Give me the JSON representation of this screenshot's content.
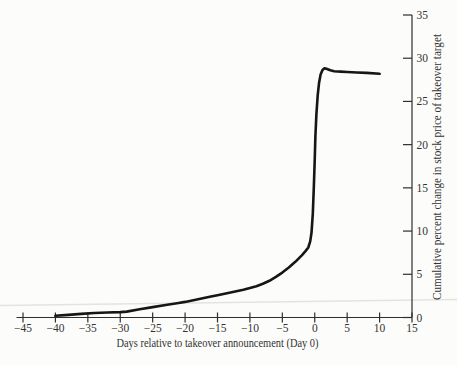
{
  "figure": {
    "background": "#fcfcfa",
    "curve_color": "#161616",
    "axis_color": "#2e2e2e",
    "label_color": "#333333",
    "artifact_line_color": "#e3e3df"
  },
  "chart_data": {
    "type": "line",
    "title": "",
    "xlabel": "Days relative to takeover announcement (Day 0)",
    "ylabel": "Cumulative percent change in stock price of takeover target",
    "xlim": [
      -45,
      15
    ],
    "ylim": [
      0,
      35
    ],
    "x_ticks": [
      -45,
      -40,
      -35,
      -30,
      -25,
      -20,
      -15,
      -10,
      -5,
      0,
      5,
      10,
      15
    ],
    "y_ticks": [
      0,
      5,
      10,
      15,
      20,
      25,
      30,
      35
    ],
    "y_axis_side": "right",
    "grid": false,
    "legend": "none",
    "series": [
      {
        "name": "Cumulative percent change in target stock price",
        "points": [
          [
            -40,
            0.2
          ],
          [
            -38,
            0.3
          ],
          [
            -36,
            0.42
          ],
          [
            -34,
            0.52
          ],
          [
            -32,
            0.58
          ],
          [
            -30,
            0.62
          ],
          [
            -29,
            0.68
          ],
          [
            -27,
            0.95
          ],
          [
            -25,
            1.2
          ],
          [
            -23,
            1.45
          ],
          [
            -21,
            1.68
          ],
          [
            -20,
            1.8
          ],
          [
            -18,
            2.12
          ],
          [
            -16,
            2.42
          ],
          [
            -15,
            2.58
          ],
          [
            -13,
            2.9
          ],
          [
            -11,
            3.2
          ],
          [
            -10,
            3.4
          ],
          [
            -9,
            3.62
          ],
          [
            -8,
            3.9
          ],
          [
            -7,
            4.25
          ],
          [
            -6,
            4.7
          ],
          [
            -5,
            5.2
          ],
          [
            -4,
            5.8
          ],
          [
            -3,
            6.45
          ],
          [
            -2,
            7.2
          ],
          [
            -1.4,
            7.7
          ],
          [
            -1,
            8.1
          ],
          [
            -0.7,
            8.8
          ],
          [
            -0.5,
            9.8
          ],
          [
            -0.3,
            12
          ],
          [
            -0.15,
            15
          ],
          [
            0,
            18.5
          ],
          [
            0.1,
            21
          ],
          [
            0.25,
            23.5
          ],
          [
            0.45,
            25.7
          ],
          [
            0.65,
            27.1
          ],
          [
            0.9,
            28.1
          ],
          [
            1.2,
            28.65
          ],
          [
            1.5,
            28.85
          ],
          [
            1.9,
            28.75
          ],
          [
            2.4,
            28.6
          ],
          [
            3,
            28.5
          ],
          [
            4,
            28.45
          ],
          [
            5,
            28.4
          ],
          [
            6.5,
            28.35
          ],
          [
            8,
            28.3
          ],
          [
            10,
            28.2
          ]
        ]
      }
    ]
  }
}
